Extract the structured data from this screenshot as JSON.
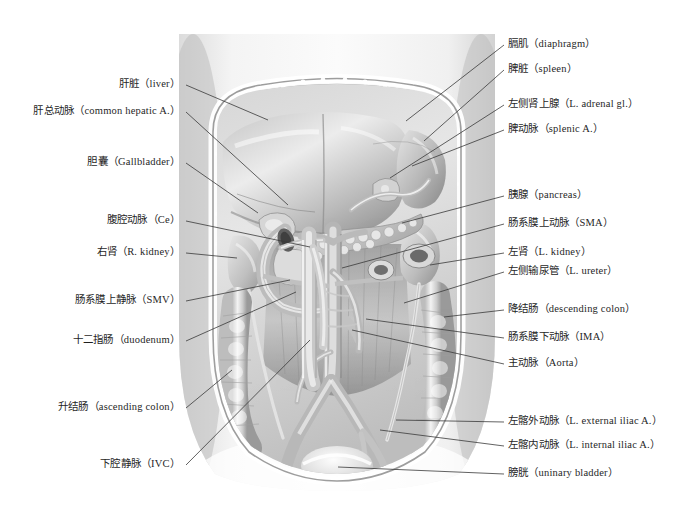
{
  "figure": {
    "style": "grayscale medical illustration",
    "colors": {
      "background": "#ffffff",
      "label_text": "#1f1f1f",
      "leader_line": "#3a3a3a",
      "illustration_light": "#f2f2f2",
      "illustration_mid": "#c8c8c8",
      "illustration_dark": "#8a8a8a",
      "illustration_shadow": "#5e5e5e"
    },
    "image_bounds": {
      "x": 173,
      "y": 34,
      "width": 328,
      "height": 457
    }
  },
  "labels_left": [
    {
      "cn": "肝脏",
      "en": "（liver）",
      "text": "肝脏（liver）",
      "x": 188,
      "y": 85,
      "line_to": {
        "x": 268,
        "y": 120
      }
    },
    {
      "cn": "肝总动脉",
      "en": "（common hepatic A.）",
      "text": "肝总动脉（common hepatic A.）",
      "x": 188,
      "y": 112,
      "line_to": {
        "x": 288,
        "y": 205
      }
    },
    {
      "cn": "胆囊",
      "en": "（Gallbladder）",
      "text": "胆囊（Gallbladder）",
      "x": 188,
      "y": 163,
      "line_to": {
        "x": 258,
        "y": 213
      }
    },
    {
      "cn": "腹腔动脉",
      "en": "（Ce）",
      "text": "腹腔动脉（Ce）",
      "x": 188,
      "y": 221,
      "line_to": {
        "x": 310,
        "y": 247
      }
    },
    {
      "cn": "右肾",
      "en": "（R. kidney）",
      "text": "右肾（R. kidney）",
      "x": 188,
      "y": 253,
      "line_to": {
        "x": 237,
        "y": 258
      }
    },
    {
      "cn": "肠系膜上静脉",
      "en": "（SMV）",
      "text": "肠系膜上静脉（SMV）",
      "x": 188,
      "y": 301,
      "line_to": {
        "x": 290,
        "y": 280
      }
    },
    {
      "cn": "十二指肠",
      "en": "（duodenum）",
      "text": "十二指肠（duodenum）",
      "x": 188,
      "y": 341,
      "line_to": {
        "x": 296,
        "y": 292
      }
    },
    {
      "cn": "升结肠",
      "en": "（ascending colon）",
      "text": "升结肠（ascending colon）",
      "x": 188,
      "y": 408,
      "line_to": {
        "x": 232,
        "y": 370
      }
    },
    {
      "cn": "下腔静脉",
      "en": "（IVC）",
      "text": "下腔静脉（IVC）",
      "x": 188,
      "y": 465,
      "line_to": {
        "x": 310,
        "y": 340
      }
    }
  ],
  "labels_right": [
    {
      "cn": "膈肌",
      "en": "（diaphragm）",
      "text": "膈肌（diaphragm）",
      "x": 508,
      "y": 45,
      "line_to": {
        "x": 406,
        "y": 121
      }
    },
    {
      "cn": "脾脏",
      "en": "（spleen）",
      "text": "脾脏（spleen）",
      "x": 508,
      "y": 70,
      "line_to": {
        "x": 424,
        "y": 141
      }
    },
    {
      "cn": "左侧肾上腺",
      "en": "（L. adrenal gl.）",
      "text": "左侧肾上腺（L. adrenal gl.）",
      "x": 508,
      "y": 105,
      "line_to": {
        "x": 390,
        "y": 178
      }
    },
    {
      "cn": "脾动脉",
      "en": "（splenic A.）",
      "text": "脾动脉（splenic A.）",
      "x": 508,
      "y": 130,
      "line_to": {
        "x": 412,
        "y": 166
      }
    },
    {
      "cn": "胰腺",
      "en": "（pancreas）",
      "text": "胰腺（pancreas）",
      "x": 508,
      "y": 196,
      "line_to": {
        "x": 402,
        "y": 223
      }
    },
    {
      "cn": "肠系膜上动脉",
      "en": "（SMA）",
      "text": "肠系膜上动脉（SMA）",
      "x": 508,
      "y": 224,
      "line_to": {
        "x": 342,
        "y": 268
      }
    },
    {
      "cn": "左肾",
      "en": "（L. kidney）",
      "text": "左肾（L. kidney）",
      "x": 508,
      "y": 253,
      "line_to": {
        "x": 430,
        "y": 265
      }
    },
    {
      "cn": "左侧输尿管",
      "en": "（L. ureter）",
      "text": "左侧输尿管（L. ureter）",
      "x": 508,
      "y": 272,
      "line_to": {
        "x": 404,
        "y": 303
      }
    },
    {
      "cn": "降结肠",
      "en": "（descending colon）",
      "text": "降结肠（descending colon）",
      "x": 508,
      "y": 310,
      "line_to": {
        "x": 444,
        "y": 317
      }
    },
    {
      "cn": "肠系膜下动脉",
      "en": "（IMA）",
      "text": "肠系膜下动脉（IMA）",
      "x": 508,
      "y": 338,
      "line_to": {
        "x": 366,
        "y": 319
      }
    },
    {
      "cn": "主动脉",
      "en": "（Aorta）",
      "text": "主动脉（Aorta）",
      "x": 508,
      "y": 364,
      "line_to": {
        "x": 352,
        "y": 330
      }
    },
    {
      "cn": "左髂外动脉",
      "en": "（L. external iliac A.）",
      "text": "左髂外动脉（L. external iliac A.）",
      "x": 508,
      "y": 422,
      "line_to": {
        "x": 396,
        "y": 420
      }
    },
    {
      "cn": "左髂内动脉",
      "en": "（L. internal iliac A.）",
      "text": "左髂内动脉（L. internal iliac A.）",
      "x": 508,
      "y": 446,
      "line_to": {
        "x": 380,
        "y": 430
      }
    },
    {
      "cn": "膀胱",
      "en": "（uninary bladder）",
      "text": "膀胱（uninary bladder）",
      "x": 508,
      "y": 474,
      "line_to": {
        "x": 338,
        "y": 467
      }
    }
  ]
}
